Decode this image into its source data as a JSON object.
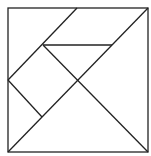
{
  "diagram": {
    "type": "tangram",
    "stroke_color": "#222222",
    "background": "#ffffff",
    "outer_square": {
      "x": 8,
      "y": 8,
      "w": 140,
      "h": 144
    },
    "lines": [
      {
        "x1": 148,
        "y1": 8,
        "x2": 8,
        "y2": 152
      },
      {
        "x1": 77,
        "y1": 8,
        "x2": 8,
        "y2": 80
      },
      {
        "x1": 43,
        "y1": 45,
        "x2": 112,
        "y2": 45
      },
      {
        "x1": 43,
        "y1": 45,
        "x2": 148,
        "y2": 152
      },
      {
        "x1": 8,
        "y1": 80,
        "x2": 42,
        "y2": 117
      }
    ]
  }
}
